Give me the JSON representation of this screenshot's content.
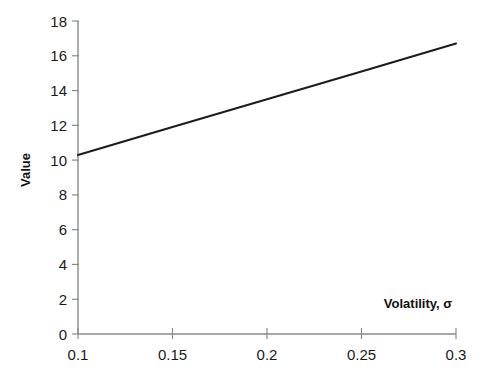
{
  "chart_data": {
    "type": "line",
    "title": "",
    "subtitle": "",
    "xlabel": "Volatility, σ",
    "ylabel": "Value",
    "xlim": [
      0.1,
      0.3
    ],
    "ylim": [
      0,
      18
    ],
    "grid": false,
    "legend": "none",
    "x_ticks": [
      0.1,
      0.15,
      0.2,
      0.25,
      0.3
    ],
    "x_tick_labels": [
      "0.1",
      "0.15",
      "0.2",
      "0.25",
      "0.3"
    ],
    "y_ticks": [
      0,
      2,
      4,
      6,
      8,
      10,
      12,
      14,
      16,
      18
    ],
    "y_tick_labels": [
      "0",
      "2",
      "4",
      "6",
      "8",
      "10",
      "12",
      "14",
      "16",
      "18"
    ],
    "series": [
      {
        "name": "Value vs Volatility",
        "color": "#1c1c1c",
        "x": [
          0.1,
          0.15,
          0.2,
          0.25,
          0.3
        ],
        "values": [
          10.3,
          11.9,
          13.5,
          15.1,
          16.7
        ]
      }
    ]
  },
  "axes": {
    "y_axis_title": "Value",
    "x_axis_title": "Volatility, σ"
  },
  "colors": {
    "background": "#ffffff",
    "axis": "#8a8a8a",
    "line": "#1c1c1c",
    "text": "#1a1a1a"
  }
}
